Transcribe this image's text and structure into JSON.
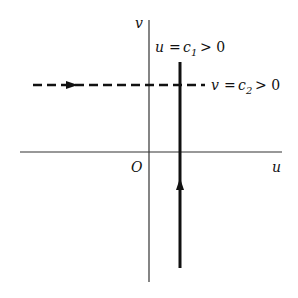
{
  "diagram": {
    "axes": {
      "horizontal_label": "u",
      "vertical_label": "v",
      "origin_label": "O"
    },
    "vertical_line": {
      "lhs": "u",
      "eq": "=",
      "c": "c",
      "sub": "1",
      "rel": "> 0",
      "arrow_direction": "up"
    },
    "horizontal_line": {
      "lhs": "v",
      "eq": "=",
      "c": "c",
      "sub": "2",
      "rel": "> 0",
      "style": "dashed",
      "arrow_direction": "right"
    },
    "colors": {
      "line": "#111111",
      "axis": "#333333",
      "background": "#ffffff"
    }
  }
}
